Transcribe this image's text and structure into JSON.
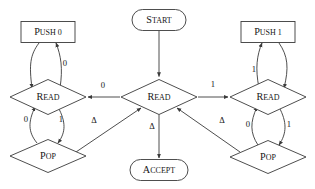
{
  "diagram": {
    "stroke_color": "#3a3a3a",
    "text_color": "#151515",
    "background_color": "#ffffff",
    "nodes": [
      {
        "id": "start",
        "label": "START",
        "shape": "rounded-rect",
        "cx": 159,
        "cy": 20,
        "w": 54,
        "h": 21
      },
      {
        "id": "push0",
        "label": "PUSH 0",
        "shape": "rect",
        "cx": 48,
        "cy": 32,
        "w": 54,
        "h": 21
      },
      {
        "id": "push1",
        "label": "PUSH 1",
        "shape": "rect",
        "cx": 268,
        "cy": 32,
        "w": 54,
        "h": 21
      },
      {
        "id": "read_left",
        "label": "READ",
        "shape": "diamond",
        "cx": 48,
        "cy": 97,
        "w": 76,
        "h": 35
      },
      {
        "id": "read_mid",
        "label": "READ",
        "shape": "diamond",
        "cx": 159,
        "cy": 97,
        "w": 76,
        "h": 35
      },
      {
        "id": "read_right",
        "label": "READ",
        "shape": "diamond",
        "cx": 268,
        "cy": 97,
        "w": 76,
        "h": 35
      },
      {
        "id": "pop_left",
        "label": "POP",
        "shape": "diamond",
        "cx": 48,
        "cy": 156,
        "w": 76,
        "h": 33
      },
      {
        "id": "pop_right",
        "label": "POP",
        "shape": "diamond",
        "cx": 268,
        "cy": 157,
        "w": 76,
        "h": 33
      },
      {
        "id": "accept",
        "label": "ACCEPT",
        "shape": "rounded-rect",
        "cx": 159,
        "cy": 170,
        "w": 58,
        "h": 21
      }
    ],
    "edges": [
      {
        "id": "start-to-read-mid",
        "from": "start",
        "to": "read_mid",
        "label": ""
      },
      {
        "id": "read-mid-to-read-left",
        "from": "read_mid",
        "to": "read_left",
        "label": "0"
      },
      {
        "id": "read-mid-to-read-right",
        "from": "read_mid",
        "to": "read_right",
        "label": "1"
      },
      {
        "id": "read-left-to-push0",
        "from": "read_left",
        "to": "push0",
        "label": "0"
      },
      {
        "id": "push0-to-read-left",
        "from": "push0",
        "to": "read_left",
        "label": ""
      },
      {
        "id": "read-right-to-push1",
        "from": "read_right",
        "to": "push1",
        "label": "1"
      },
      {
        "id": "push1-to-read-right",
        "from": "push1",
        "to": "read_right",
        "label": ""
      },
      {
        "id": "read-left-to-pop-left",
        "from": "read_left",
        "to": "pop_left",
        "label": "1"
      },
      {
        "id": "pop-left-to-read-left",
        "from": "pop_left",
        "to": "read_left",
        "label": "0"
      },
      {
        "id": "read-right-to-pop-right",
        "from": "read_right",
        "to": "pop_right",
        "label": "1"
      },
      {
        "id": "pop-right-to-read-right",
        "from": "pop_right",
        "to": "read_right",
        "label": "0"
      },
      {
        "id": "pop-left-to-read-mid",
        "from": "pop_left",
        "to": "read_mid",
        "label": "Δ"
      },
      {
        "id": "pop-right-to-read-mid",
        "from": "pop_right",
        "to": "read_mid",
        "label": "Δ"
      },
      {
        "id": "read-mid-to-accept",
        "from": "read_mid",
        "to": "accept",
        "label": "Δ"
      }
    ],
    "labels": {
      "start": "START",
      "accept": "ACCEPT",
      "push0": "PUSH 0",
      "push1": "PUSH 1",
      "read": "READ",
      "pop": "POP",
      "zero": "0",
      "one": "1",
      "delta": "Δ"
    },
    "node_text": {
      "start_head": "S",
      "start_tail": "TART",
      "accept_head": "A",
      "accept_tail": "CCEPT",
      "push_head": "P",
      "push0_tail": "USH 0",
      "push1_tail": "USH 1",
      "read_head": "R",
      "read_tail": "EAD",
      "pop_head": "P",
      "pop_tail": "OP"
    }
  }
}
